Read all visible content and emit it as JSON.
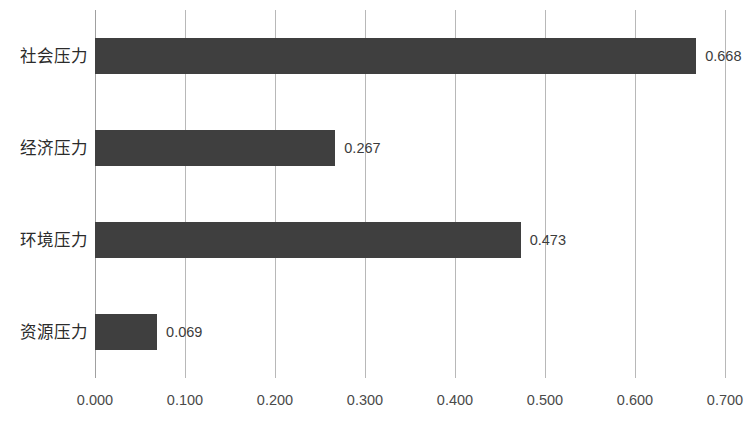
{
  "chart_data": {
    "type": "bar",
    "orientation": "horizontal",
    "title": "",
    "subtitle": "",
    "xlabel": "",
    "ylabel": "",
    "categories": [
      "社会压力",
      "经济压力",
      "环境压力",
      "资源压力"
    ],
    "values": [
      0.668,
      0.267,
      0.473,
      0.069
    ],
    "value_labels": [
      "0.668",
      "0.267",
      "0.473",
      "0.069"
    ],
    "xlim": [
      0.0,
      0.7
    ],
    "xticks": [
      0.0,
      0.1,
      0.2,
      0.3,
      0.4,
      0.5,
      0.6,
      0.7
    ],
    "xtick_labels": [
      "0.000",
      "0.100",
      "0.200",
      "0.300",
      "0.400",
      "0.500",
      "0.600",
      "0.700"
    ],
    "grid": "vertical",
    "legend": "none",
    "series": [
      {
        "name": "",
        "values": [
          0.668,
          0.267,
          0.473,
          0.069
        ]
      }
    ],
    "colors": {
      "bar_fill": "#3f3f3f",
      "gridline": "#b8b8b8",
      "axis_line": "#a0a0a0",
      "tick_text": "#4a4a4a",
      "category_text": "#2b2b2b",
      "value_text": "#3c3c3c",
      "background": "#ffffff"
    }
  }
}
